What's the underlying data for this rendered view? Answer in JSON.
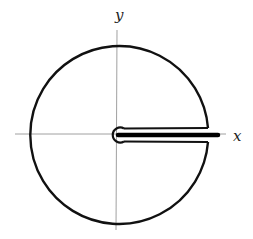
{
  "diagram": {
    "type": "keyhole-contour",
    "axes": {
      "x_label": "x",
      "y_label": "y"
    },
    "colors": {
      "contour": "#111111",
      "axis": "#888888",
      "branch_cut": "#000000"
    },
    "elements": [
      "outer circle of large radius",
      "small circle around origin",
      "two parallel segments above and below positive real axis",
      "branch cut along positive x-axis"
    ]
  }
}
